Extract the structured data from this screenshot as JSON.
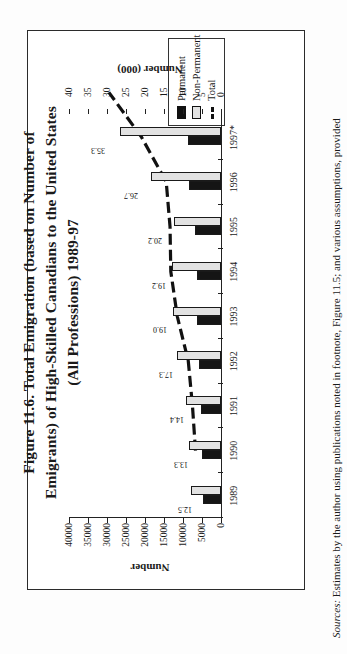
{
  "figure": {
    "title_lines": [
      "Figure 11.6. Total Emigration (based on Number of",
      "Emigrants) of High-Skilled Canadians to the United States",
      "(All Professions) 1989-97"
    ],
    "sources_label": "Sources:",
    "sources_text": " Estimates by the author using publications noted in footnote, Figure 11.5; and various assumptions, provided"
  },
  "legend": {
    "items": [
      {
        "label": "Permanent",
        "key": "solid-black-square",
        "color": "#151515"
      },
      {
        "label": "Non-Permanent",
        "key": "light-gray-square",
        "color": "#e2e2e2"
      },
      {
        "label": "Total",
        "key": "dashed-line",
        "color": "#111111"
      }
    ]
  },
  "chart_data": {
    "type": "bar",
    "title": "Figure 11.6. Total Emigration (based on Number of Emigrants) of High-Skilled Canadians to the United States (All Professions) 1989-97",
    "categories": [
      "1989",
      "1990",
      "1991",
      "1992",
      "1993",
      "1994",
      "1995",
      "1996",
      "1997*"
    ],
    "xlabel": "",
    "ylabel": "Number",
    "ylabel_secondary": "Number (000)",
    "ylim": [
      0,
      40000
    ],
    "ylim_secondary": [
      0,
      40
    ],
    "yticks": [
      "0",
      "5000",
      "10000",
      "15000",
      "20000",
      "25000",
      "30000",
      "35000",
      "40000"
    ],
    "yticks_secondary": [
      "0",
      "5",
      "10",
      "15",
      "20",
      "25",
      "30",
      "35",
      "40"
    ],
    "grid": false,
    "legend_position": "top-right",
    "series": [
      {
        "name": "Permanent",
        "type": "bar",
        "color": "#151515",
        "values": [
          4700,
          5000,
          5200,
          5800,
          6300,
          6400,
          6900,
          8300,
          8600
        ]
      },
      {
        "name": "Non-Permanent",
        "type": "bar",
        "color": "#e2e2e2",
        "values": [
          7800,
          8300,
          9200,
          11500,
          12700,
          12800,
          12300,
          18400,
          26700
        ]
      },
      {
        "name": "Total",
        "type": "line",
        "color": "#111111",
        "style": "dashed",
        "values": [
          12500,
          13300,
          14400,
          17300,
          19000,
          19200,
          20200,
          26700,
          35300
        ],
        "data_labels": [
          "12.5",
          "13.3",
          "14.4",
          "17.3",
          "19.0",
          "19.2",
          "20.2",
          "26.7",
          "35.3"
        ]
      }
    ]
  }
}
